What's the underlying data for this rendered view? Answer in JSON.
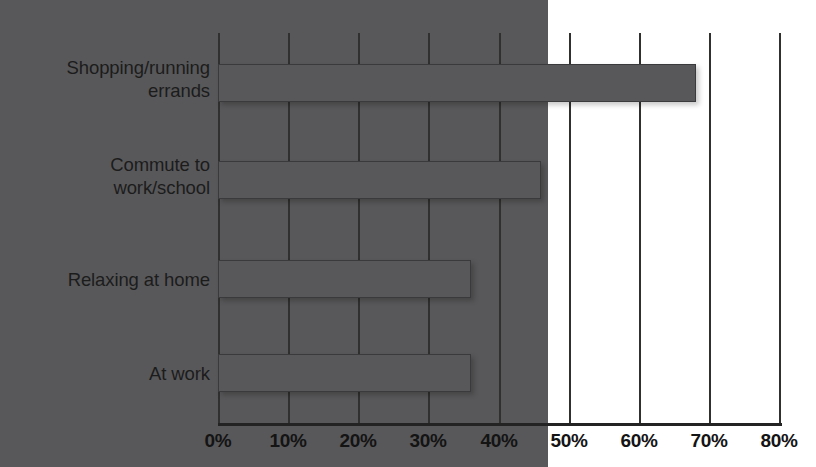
{
  "chart_data": {
    "type": "bar",
    "orientation": "horizontal",
    "title": "",
    "subtitle": "",
    "xlabel": "",
    "ylabel": "",
    "categories": [
      "Shopping/running\nerrands",
      "Commute to\nwork/school",
      "Relaxing at home",
      "At work"
    ],
    "values": [
      78,
      68,
      46,
      36
    ],
    "value_suffix": "%",
    "xlim": [
      0,
      80
    ],
    "xticks": [
      0,
      10,
      20,
      30,
      40,
      50,
      60,
      70,
      80
    ],
    "xtick_labels": [
      "0%",
      "10%",
      "20%",
      "30%",
      "40%",
      "50%",
      "60%",
      "70%",
      "80%"
    ],
    "grid": "vertical",
    "legend": "none",
    "series": [
      {
        "name": "",
        "values": [
          78,
          68,
          46,
          36
        ]
      }
    ],
    "colors": {
      "bar_fill": "#58585a",
      "bar_border": "#3a3a3c",
      "gridline": "#30302f",
      "axis": "#232323",
      "background": "#fdfdfc",
      "text": "#1c1c1c"
    }
  }
}
